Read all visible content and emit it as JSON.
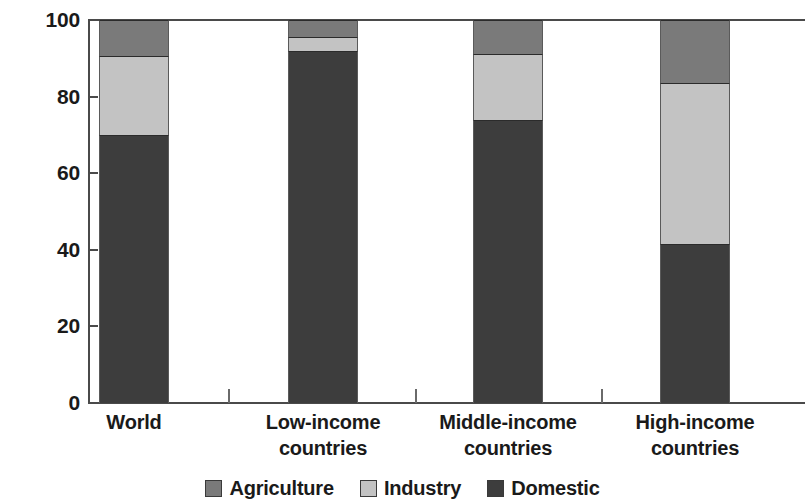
{
  "chart_data": {
    "type": "bar",
    "subtype": "stacked-bar-100-percent",
    "title": "",
    "subtitle": "",
    "xlabel": "",
    "ylabel": "",
    "categories": [
      "World",
      "Low-income countries",
      "Middle-income countries",
      "High-income countries"
    ],
    "category_lines": [
      [
        "World"
      ],
      [
        "Low-income",
        "countries"
      ],
      [
        "Middle-income",
        "countries"
      ],
      [
        "High-income",
        "countries"
      ]
    ],
    "series": [
      {
        "name": "Domestic",
        "color": "#3d3d3d",
        "values": [
          70.0,
          92.0,
          74.0,
          41.5
        ]
      },
      {
        "name": "Industry",
        "color": "#c3c3c3",
        "values": [
          20.5,
          3.5,
          17.0,
          42.0
        ]
      },
      {
        "name": "Agriculture",
        "color": "#7a7a7a",
        "values": [
          9.5,
          4.5,
          9.0,
          16.5
        ]
      }
    ],
    "stack_order_bottom_to_top": [
      "Domestic",
      "Industry",
      "Agriculture"
    ],
    "ylim": [
      0,
      100
    ],
    "yticks": [
      0,
      20,
      40,
      60,
      80,
      100
    ],
    "ytick_labels": [
      "0",
      "20",
      "40",
      "60",
      "80",
      "100"
    ],
    "grid": false,
    "legend_position": "bottom",
    "legend_entries": [
      {
        "label": "Agriculture",
        "color": "#7a7a7a"
      },
      {
        "label": "Industry",
        "color": "#c3c3c3"
      },
      {
        "label": "Domestic",
        "color": "#3d3d3d"
      }
    ],
    "axis_color": "#4a4a4a",
    "background_color": "#ffffff"
  }
}
